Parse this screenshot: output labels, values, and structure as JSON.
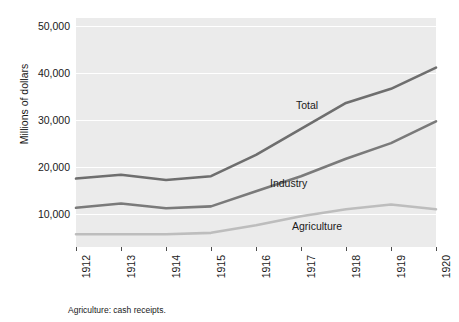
{
  "figure": {
    "footnote": "Agriculture: cash receipts."
  },
  "axes": {
    "y_title": "Millions of dollars",
    "y_ticks": [
      "10,000",
      "20,000",
      "30,000",
      "40,000",
      "50,000"
    ],
    "x_ticks": [
      "1912",
      "1913",
      "1914",
      "1915",
      "1916",
      "1917",
      "1918",
      "1919",
      "1920"
    ]
  },
  "series_labels": {
    "total": "Total",
    "industry": "Industry",
    "agriculture": "Agriculture"
  },
  "colors": {
    "panel_background": "#ebebeb",
    "gridline": "#ffffff",
    "total_line": "#6e6e6e",
    "industry_line": "#7a7a7a",
    "agriculture_line": "#bdbdbd",
    "text": "#1a1a1a"
  },
  "chart_data": {
    "type": "line",
    "title": "",
    "subtitle": "",
    "xlabel": "",
    "ylabel": "Millions of dollars",
    "x": [
      1912,
      1913,
      1914,
      1915,
      1916,
      1917,
      1918,
      1919,
      1920
    ],
    "xlim": [
      1912,
      1920
    ],
    "ylim": [
      3000,
      51500
    ],
    "ytick_values": [
      10000,
      20000,
      30000,
      40000,
      50000
    ],
    "grid": "horizontal",
    "legend": "inline-labels",
    "note": "Agriculture: cash receipts.",
    "series": [
      {
        "name": "Total",
        "color": "#6e6e6e",
        "values": [
          17500,
          18300,
          17200,
          18000,
          22500,
          28000,
          33500,
          36500,
          41000
        ]
      },
      {
        "name": "Industry",
        "color": "#7a7a7a",
        "values": [
          11300,
          12200,
          11200,
          11600,
          14800,
          18000,
          21700,
          25000,
          29600
        ]
      },
      {
        "name": "Agriculture",
        "color": "#bdbdbd",
        "values": [
          5700,
          5700,
          5700,
          6000,
          7600,
          9500,
          11000,
          12000,
          11000
        ]
      }
    ]
  }
}
